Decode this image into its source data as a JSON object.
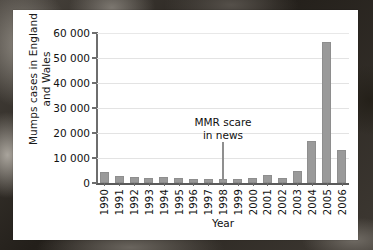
{
  "chart_data": {
    "type": "bar",
    "title": "",
    "subtitle": "",
    "xlabel": "Year",
    "ylabel": "Mumps cases in England and Wales",
    "ylabel_line1": "Mumps cases in England",
    "ylabel_line2": "and Wales",
    "categories": [
      "1990",
      "1991",
      "1992",
      "1993",
      "1994",
      "1995",
      "1996",
      "1997",
      "1998",
      "1999",
      "2000",
      "2001",
      "2002",
      "2003",
      "2004",
      "2005",
      "2006"
    ],
    "values": [
      4300,
      2900,
      2400,
      2100,
      2500,
      2000,
      1700,
      1800,
      1700,
      1700,
      2200,
      3100,
      2200,
      4700,
      16700,
      56400,
      13400
    ],
    "ylim": [
      0,
      60000
    ],
    "xlim_note": "categorical",
    "yticks": [
      0,
      10000,
      20000,
      30000,
      40000,
      50000,
      60000
    ],
    "ytick_labels": [
      "0",
      "10 000",
      "20 000",
      "30 000",
      "40 000",
      "50 000",
      "60 000"
    ],
    "grid": "horizontal",
    "legend": "none",
    "bar_color": "#9a9a9a",
    "annotations": [
      {
        "text_line1": "MMR scare",
        "text_line2": "in news",
        "points_to_category": "1998",
        "text": "MMR scare in news"
      }
    ]
  },
  "colors": {
    "bar": "#9a9a9a",
    "gridline": "#e3e3e3",
    "axis": "#6e6e6e",
    "text": "#111111",
    "panel": "#ffffff"
  }
}
